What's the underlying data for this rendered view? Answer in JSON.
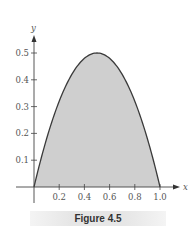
{
  "figure": {
    "caption": "Figure 4.5"
  },
  "chart_data": {
    "type": "area",
    "title": "",
    "xlabel": "x",
    "ylabel": "y",
    "function": "y = 2x(1 - x)",
    "x": [
      0.0,
      0.1,
      0.2,
      0.3,
      0.4,
      0.5,
      0.6,
      0.7,
      0.8,
      0.9,
      1.0
    ],
    "y": [
      0.0,
      0.18,
      0.32,
      0.42,
      0.48,
      0.5,
      0.48,
      0.42,
      0.32,
      0.18,
      0.0
    ],
    "xlim": [
      0,
      1.1
    ],
    "ylim": [
      0,
      0.55
    ],
    "x_ticks": [
      "0.2",
      "0.4",
      "0.6",
      "0.8",
      "1.0"
    ],
    "y_ticks": [
      "0.1",
      "0.2",
      "0.3",
      "0.4",
      "0.5"
    ],
    "fill_color": "#cfcfcf",
    "line_color": "#333333",
    "grid": false,
    "legend": null
  }
}
